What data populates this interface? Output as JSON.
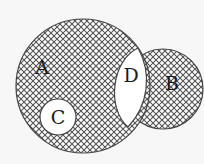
{
  "diagram": {
    "type": "venn",
    "background": "#f7f7f7",
    "hatch": {
      "style": "crosshatch",
      "angle_deg": 45,
      "spacing_px": 6,
      "line_color": "#555555",
      "fill_color": "#ffffff"
    },
    "shapes": [
      {
        "id": "A",
        "label": "A",
        "kind": "circle",
        "cx": 83,
        "cy": 86,
        "r": 67,
        "shaded": true,
        "label_x": 42,
        "label_y": 74
      },
      {
        "id": "B",
        "label": "B",
        "kind": "circle",
        "cx": 163,
        "cy": 89,
        "r": 40,
        "shaded": true,
        "label_x": 172,
        "label_y": 90
      },
      {
        "id": "C",
        "label": "C",
        "kind": "circle",
        "cx": 58,
        "cy": 117,
        "r": 18,
        "shaded": false,
        "label_x": 58,
        "label_y": 124
      },
      {
        "id": "D",
        "label": "D",
        "kind": "lens",
        "shaded": false,
        "label_x": 131,
        "label_y": 82
      }
    ],
    "labels": {
      "a": "A",
      "b": "B",
      "c": "C",
      "d": "D"
    }
  }
}
